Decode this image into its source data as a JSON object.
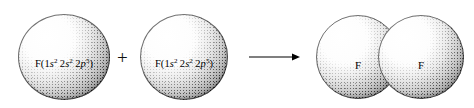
{
  "diagram": {
    "reaction_type": "covalent-bond-formation",
    "reactants": [
      {
        "element": "F",
        "label_prefix": "F(",
        "label_suffix": ")",
        "configuration": [
          {
            "shell": "1",
            "orbital": "s",
            "electrons": "2"
          },
          {
            "shell": "2",
            "orbital": "s",
            "electrons": "2"
          },
          {
            "shell": "2",
            "orbital": "p",
            "electrons": "5"
          }
        ],
        "label_plain": "F(1s2 2s2 2p5)"
      },
      {
        "element": "F",
        "label_prefix": "F(",
        "label_suffix": ")",
        "configuration": [
          {
            "shell": "1",
            "orbital": "s",
            "electrons": "2"
          },
          {
            "shell": "2",
            "orbital": "s",
            "electrons": "2"
          },
          {
            "shell": "2",
            "orbital": "p",
            "electrons": "5"
          }
        ],
        "label_plain": "F(1s2 2s2 2p5)"
      }
    ],
    "operators": {
      "plus": "+",
      "arrow": "arrow-right"
    },
    "products": [
      {
        "element": "F",
        "label": "F"
      },
      {
        "element": "F",
        "label": "F"
      }
    ],
    "colors": {
      "background": "#ffffff",
      "ink": "#000000",
      "sphere_highlight": "#ffffff",
      "sphere_shadow": "#d2d2d2"
    }
  }
}
